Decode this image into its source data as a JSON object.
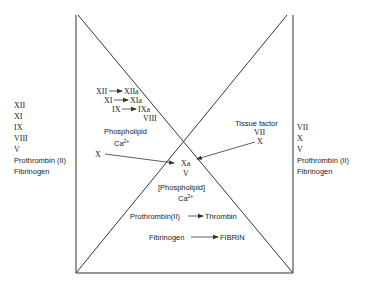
{
  "left_labels": [
    "XII",
    "XI",
    "IX",
    "VIII",
    "V",
    "Prothrombin (II)",
    "Fibrinogen"
  ],
  "right_labels": [
    "VII",
    "X",
    "V",
    "Prothrombin (II)",
    "Fibrinogen"
  ],
  "intrinsic": {
    "cascade": [
      {
        "from": "XII",
        "to": "XIIa"
      },
      {
        "from": "XI",
        "to": "XIa"
      },
      {
        "from": "IX",
        "to": "IXa"
      }
    ],
    "cofactor": "VIII",
    "phospholipid": "Phospholipid",
    "calcium": "Ca",
    "calcium_sup": "2+",
    "substrate": "X"
  },
  "extrinsic": {
    "tissue_factor": "Tissue factor",
    "factor": "VII",
    "substrate": "X"
  },
  "common": {
    "activated": "Xa",
    "cofactor": "V",
    "phospholipid": "[Phospholipid]",
    "calcium": "Ca",
    "calcium_sup": "2+",
    "reactions": [
      {
        "from": "Prothrombin(II)",
        "to": "Thrombin"
      },
      {
        "from": "Fibrinogen",
        "to": "FIBRIN"
      }
    ]
  }
}
